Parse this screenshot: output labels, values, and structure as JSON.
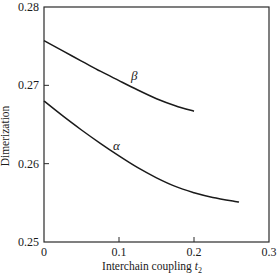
{
  "chart_data": {
    "type": "line",
    "title": "",
    "xlabel": "Interchain coupling t2",
    "xlabel_main": "Interchain coupling ",
    "xlabel_var": "t",
    "xlabel_sub": "2",
    "ylabel": "Dimerization",
    "xlim": [
      0,
      0.3
    ],
    "ylim": [
      0.25,
      0.28
    ],
    "xticks": [
      "0",
      "0.1",
      "0.2",
      "0.3"
    ],
    "yticks": [
      "0.25",
      "0.26",
      "0.27",
      "0.28"
    ],
    "grid": false,
    "legend": "inline labels",
    "series": [
      {
        "name": "β",
        "x": [
          0,
          0.025,
          0.05,
          0.075,
          0.1,
          0.125,
          0.15,
          0.175,
          0.2
        ],
        "values": [
          0.2757,
          0.2744,
          0.2731,
          0.2718,
          0.2706,
          0.2694,
          0.2683,
          0.2674,
          0.2667
        ]
      },
      {
        "name": "α",
        "x": [
          0,
          0.025,
          0.05,
          0.075,
          0.1,
          0.125,
          0.15,
          0.175,
          0.2,
          0.225,
          0.26
        ],
        "values": [
          0.268,
          0.2661,
          0.2643,
          0.2626,
          0.261,
          0.2595,
          0.2582,
          0.2571,
          0.2563,
          0.2557,
          0.2551
        ]
      }
    ]
  }
}
